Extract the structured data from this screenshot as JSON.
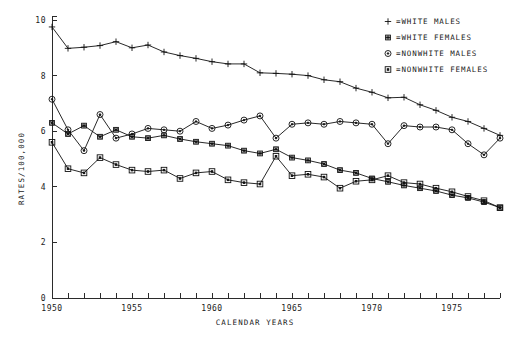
{
  "chart_data": {
    "type": "line",
    "title": "",
    "xlabel": "CALENDAR YEARS",
    "ylabel": "RATES/100,000",
    "xlim": [
      1950,
      1978
    ],
    "ylim": [
      0,
      10
    ],
    "xticks": [
      1950,
      1951,
      1952,
      1953,
      1954,
      1955,
      1956,
      1957,
      1958,
      1959,
      1960,
      1961,
      1962,
      1963,
      1964,
      1965,
      1966,
      1967,
      1968,
      1969,
      1970,
      1971,
      1972,
      1973,
      1974,
      1975,
      1976,
      1977,
      1978
    ],
    "xtick_labels_shown": [
      "1950",
      "1955",
      "1960",
      "1965",
      "1970",
      "1975"
    ],
    "yticks": [
      0,
      2,
      4,
      6,
      8,
      10
    ],
    "ytick_labels_shown": [
      "0",
      "2",
      "4",
      "6",
      "8",
      "10"
    ],
    "grid": false,
    "legend_position": "top-right",
    "x": [
      1950,
      1951,
      1952,
      1953,
      1954,
      1955,
      1956,
      1957,
      1958,
      1959,
      1960,
      1961,
      1962,
      1963,
      1964,
      1965,
      1966,
      1967,
      1968,
      1969,
      1970,
      1971,
      1972,
      1973,
      1974,
      1975,
      1976,
      1977,
      1978
    ],
    "series": [
      {
        "name": "WHITE MALES",
        "marker": "plus",
        "values": [
          9.75,
          8.98,
          9.02,
          9.08,
          9.22,
          9.0,
          9.1,
          8.85,
          8.72,
          8.62,
          8.5,
          8.42,
          8.42,
          8.1,
          8.08,
          8.05,
          8.0,
          7.85,
          7.78,
          7.55,
          7.4,
          7.2,
          7.22,
          6.95,
          6.75,
          6.5,
          6.35,
          6.1,
          5.85
        ]
      },
      {
        "name": "WHITE FEMALES",
        "marker": "asterisk",
        "values": [
          6.3,
          5.9,
          6.2,
          5.8,
          6.05,
          5.8,
          5.75,
          5.85,
          5.72,
          5.62,
          5.55,
          5.48,
          5.3,
          5.2,
          5.35,
          5.05,
          4.95,
          4.82,
          4.6,
          4.5,
          4.3,
          4.18,
          4.05,
          3.95,
          3.85,
          3.7,
          3.6,
          3.45,
          3.25
        ]
      },
      {
        "name": "NONWHITE MALES",
        "marker": "circle-dot",
        "values": [
          7.15,
          6.05,
          5.3,
          6.6,
          5.75,
          5.9,
          6.1,
          6.05,
          6.0,
          6.35,
          6.1,
          6.22,
          6.4,
          6.55,
          5.75,
          6.25,
          6.3,
          6.25,
          6.35,
          6.3,
          6.25,
          5.55,
          6.2,
          6.15,
          6.15,
          6.05,
          5.55,
          5.15,
          5.75
        ]
      },
      {
        "name": "NONWHITE FEMALES",
        "marker": "square-dot",
        "values": [
          5.6,
          4.65,
          4.5,
          5.05,
          4.8,
          4.6,
          4.55,
          4.6,
          4.3,
          4.5,
          4.55,
          4.25,
          4.15,
          4.1,
          5.1,
          4.4,
          4.45,
          4.35,
          3.95,
          4.2,
          4.25,
          4.4,
          4.15,
          4.1,
          3.95,
          3.82,
          3.65,
          3.5,
          3.25
        ]
      }
    ]
  },
  "legend": {
    "entries": [
      {
        "symbol": "+",
        "separator": "=",
        "label": "WHITE MALES"
      },
      {
        "symbol": "*",
        "separator": "=",
        "label": "WHITE FEMALES"
      },
      {
        "symbol": "o",
        "separator": "=",
        "label": "NONWHITE MALES"
      },
      {
        "symbol": "[]",
        "separator": "=",
        "label": "NONWHITE FEMALES"
      }
    ]
  },
  "colors": {
    "ink": "#111111",
    "background": "#ffffff"
  }
}
